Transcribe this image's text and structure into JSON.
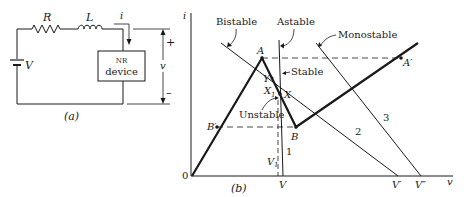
{
  "figure_a": {
    "caption": "(a)",
    "resistor_label": "R",
    "inductor_label": "L",
    "source_label": "V",
    "current_label": "i",
    "device_line1": "NR",
    "device_line2": "device",
    "voltage_label": "v",
    "plus_sign": "+",
    "minus_sign": "–"
  },
  "figure_b": {
    "caption": "(b)",
    "y_axis_label": "i",
    "x_axis_label": "v",
    "origin_label": "0",
    "points": {
      "A": "A",
      "A_prime": "A′",
      "B": "B",
      "B_prime": "B′",
      "Y": "Y",
      "X": "X",
      "X1": "X",
      "X1_sub": "1"
    },
    "x_ticks": {
      "V1": "V",
      "V1_sub": "1",
      "V": "V",
      "V_prime": "V′",
      "V_double_prime": "V″"
    },
    "load_lines": [
      {
        "id": "1",
        "name": "Astable",
        "number": "1"
      },
      {
        "id": "2",
        "name": "Bistable",
        "number": "2"
      },
      {
        "id": "3",
        "name": "Monostable",
        "number": "3"
      }
    ],
    "annotations": {
      "stable": "Stable",
      "unstable": "Unstable"
    }
  }
}
